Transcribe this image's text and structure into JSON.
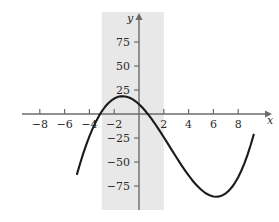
{
  "chart_data": {
    "type": "line",
    "title": "",
    "xlabel": "x",
    "ylabel": "y",
    "xlim": [
      -9.5,
      10.5
    ],
    "ylim": [
      -95,
      95
    ],
    "grid": false,
    "legend": null,
    "xticks": [
      -8,
      -6,
      -4,
      -2,
      2,
      4,
      6,
      8
    ],
    "xtick_labels": [
      "−8",
      "−6",
      "−4",
      "−2",
      "2",
      "4",
      "6",
      "8"
    ],
    "yticks": [
      75,
      50,
      25,
      -25,
      -50,
      -75
    ],
    "ytick_labels": [
      "75",
      "50",
      "25",
      "−25",
      "−50",
      "−75"
    ],
    "shaded_region": {
      "x_start": -3,
      "x_end": 2,
      "color": "#e8e8e8",
      "label": "shaded-band"
    },
    "curve": {
      "name": "cubic",
      "color": "#1a1a1a",
      "roots": [
        -4,
        0.5,
        6.4
      ],
      "local_max": {
        "x": -2,
        "y": 13
      },
      "local_min": {
        "x": 4,
        "y": -27
      },
      "x": [
        -5.0,
        -4.75,
        -4.5,
        -4.25,
        -4.0,
        -3.75,
        -3.5,
        -3.25,
        -3.0,
        -2.75,
        -2.5,
        -2.25,
        -2.0,
        -1.75,
        -1.5,
        -1.25,
        -1.0,
        -0.75,
        -0.5,
        -0.25,
        0.0,
        0.25,
        0.5,
        0.75,
        1.0,
        1.25,
        1.5,
        1.75,
        2.0,
        2.25,
        2.5,
        2.75,
        3.0,
        3.25,
        3.5,
        3.75,
        4.0,
        4.25,
        4.5,
        4.75,
        5.0,
        5.25,
        5.5,
        5.75,
        6.0,
        6.25,
        6.5,
        6.75,
        7.0,
        7.25,
        7.5,
        7.75,
        8.0,
        8.25,
        8.5,
        8.75,
        9.0,
        9.25
      ],
      "y": [
        -62.6,
        -51.6,
        -41.3,
        -31.9,
        -23.3,
        -15.5,
        -8.6,
        -2.5,
        2.8,
        7.3,
        11.0,
        13.9,
        16.1,
        17.6,
        18.4,
        18.5,
        18.0,
        16.9,
        15.2,
        13.0,
        10.2,
        7.0,
        3.4,
        -0.6,
        -4.9,
        -9.4,
        -14.2,
        -19.1,
        -24.2,
        -29.3,
        -34.5,
        -39.7,
        -44.8,
        -49.9,
        -54.8,
        -59.5,
        -64.0,
        -68.2,
        -72.1,
        -75.6,
        -78.7,
        -81.3,
        -83.4,
        -85.0,
        -85.9,
        -86.2,
        -85.8,
        -84.6,
        -82.6,
        -79.8,
        -76.1,
        -71.4,
        -65.8,
        -59.1,
        -51.4,
        -42.6,
        -32.6,
        -21.5
      ]
    }
  },
  "axes": {
    "x_axis_name": "x",
    "y_axis_name": "y",
    "x_axis_arrow": "arrow-right",
    "y_axis_arrow": "arrow-up"
  }
}
